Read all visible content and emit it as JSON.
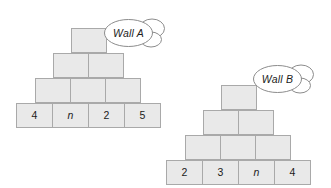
{
  "diagram": {
    "type": "brick-wall-pyramid-pair",
    "background_color": "#ffffff",
    "brick_fill_color": "#e9e9e9",
    "brick_border_color": "#a9a9a9",
    "walls": [
      {
        "id": "wall-a",
        "label": "Wall A",
        "rows_top_to_bottom": [
          {
            "cells": [
              ""
            ]
          },
          {
            "cells": [
              "",
              ""
            ]
          },
          {
            "cells": [
              "",
              "",
              ""
            ]
          },
          {
            "cells": [
              "4",
              "n",
              "2",
              "5"
            ]
          }
        ],
        "bottom_row_values": [
          "4",
          "n",
          "2",
          "5"
        ],
        "variable_cells": [
          "n"
        ]
      },
      {
        "id": "wall-b",
        "label": "Wall B",
        "rows_top_to_bottom": [
          {
            "cells": [
              ""
            ]
          },
          {
            "cells": [
              "",
              ""
            ]
          },
          {
            "cells": [
              "",
              "",
              ""
            ]
          },
          {
            "cells": [
              "2",
              "3",
              "n",
              "4"
            ]
          }
        ],
        "bottom_row_values": [
          "2",
          "3",
          "n",
          "4"
        ],
        "variable_cells": [
          "n"
        ]
      }
    ]
  }
}
